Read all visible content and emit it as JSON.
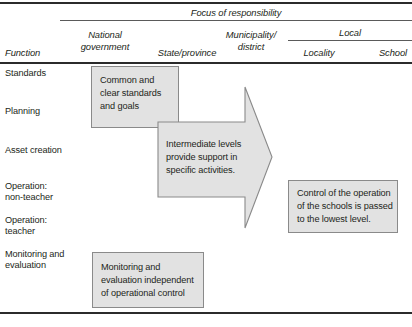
{
  "table": {
    "corner_label": "Function",
    "group_header": "Focus of responsibility",
    "subgroup_header": "Local",
    "columns": [
      {
        "label": "National\ngovernment"
      },
      {
        "label": "State/province"
      },
      {
        "label": "Municipality/\ndistrict"
      },
      {
        "label": "Locality"
      },
      {
        "label": "School"
      }
    ],
    "rows": [
      {
        "label": "Standards"
      },
      {
        "label": "Planning"
      },
      {
        "label": "Asset creation"
      },
      {
        "label": "Operation:\nnon-teacher"
      },
      {
        "label": "Operation:\nteacher"
      },
      {
        "label": "Monitoring and\nevaluation"
      }
    ]
  },
  "callouts": {
    "standards_box": "Common and\nclear standards\nand goals",
    "arrow": "Intermediate levels\nprovide support in\nspecific activities.",
    "control_box": "Control of the operation\nof the schools is passed\nto the lowest level.",
    "monitoring_box": "Monitoring and\nevaluation independent\nof operational control"
  },
  "style": {
    "box_fill": "#e2e2e2",
    "box_stroke": "#8a8a8a",
    "rule_color": "#3a3a3a",
    "text_color": "#231f20"
  }
}
